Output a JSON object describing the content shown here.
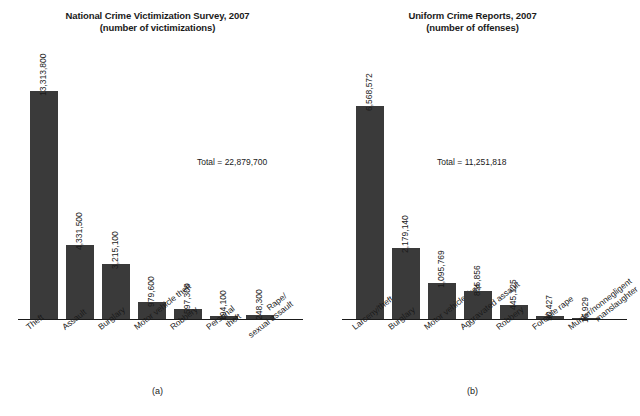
{
  "figure": {
    "background": "#ffffff",
    "bar_color": "#3a3a3a",
    "axis_color": "#1a1a1a"
  },
  "panels": [
    {
      "caption": "(a)",
      "title_line1": "National Crime Victimization Survey, 2007",
      "title_line2": "(number of victimizations)",
      "total_label": "Total = 22,879,700"
    },
    {
      "caption": "(b)",
      "title_line1": "Uniform Crime Reports, 2007",
      "title_line2": "(number of offenses)",
      "total_label": "Total = 11,251,818"
    }
  ],
  "chart_data": [
    {
      "type": "bar",
      "title": "National Crime Victimization Survey, 2007 (number of victimizations)",
      "subtitle": "(number of victimizations)",
      "xlabel": "",
      "ylabel": "",
      "grid": false,
      "legend": "none",
      "ylim": [
        0,
        13313800
      ],
      "total": 22879700,
      "total_label": "Total = 22,879,700",
      "categories": [
        "Theft",
        "Assault",
        "Burglary",
        "Motor vehicle theft",
        "Robbery",
        "Personal theft",
        "Rape/sexual assault"
      ],
      "category_lines": [
        [
          "Theft"
        ],
        [
          "Assault"
        ],
        [
          "Burglary"
        ],
        [
          "Motor vehicle theft"
        ],
        [
          "Robbery"
        ],
        [
          "Personal",
          "theft"
        ],
        [
          "Rape/",
          "sexual assault"
        ]
      ],
      "values": [
        13313800,
        4331500,
        3215100,
        979600,
        597300,
        194100,
        248300
      ],
      "value_labels": [
        "13,313,800",
        "4,331,500",
        "3,215,100",
        "979,600",
        "597,300",
        "194,100",
        "248,300"
      ]
    },
    {
      "type": "bar",
      "title": "Uniform Crime Reports, 2007 (number of offenses)",
      "subtitle": "(number of offenses)",
      "xlabel": "",
      "ylabel": "",
      "grid": false,
      "legend": "none",
      "ylim": [
        0,
        6568572
      ],
      "total": 11251818,
      "total_label": "Total = 11,251,818",
      "categories": [
        "Larceny/theft",
        "Burglary",
        "Motor vehicle theft",
        "Aggravated assault",
        "Robbery",
        "Forcible rape",
        "Murder/nonnegligent manslaughter"
      ],
      "category_lines": [
        [
          "Larceny/theft"
        ],
        [
          "Burglary"
        ],
        [
          "Motor vehicle theft"
        ],
        [
          "Aggravated assault"
        ],
        [
          "Robbery"
        ],
        [
          "Forcible rape"
        ],
        [
          "Murder/nonnegligent",
          "manslaughter"
        ]
      ],
      "values": [
        6568572,
        2179140,
        1095769,
        855856,
        445125,
        90427,
        16929
      ],
      "value_labels": [
        "6,568,572",
        "2,179,140",
        "1,095,769",
        "855,856",
        "445,125",
        "90,427",
        "16,929"
      ]
    }
  ]
}
